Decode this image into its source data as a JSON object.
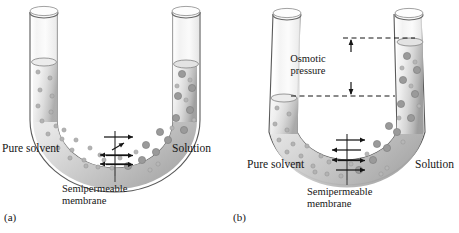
{
  "figure": {
    "background_color": "#ffffff",
    "ink_color": "#161616"
  },
  "panels": [
    {
      "id": "a",
      "sublabel": "(a)",
      "left_label": "Pure solvent",
      "right_label": "Solution",
      "membrane_label": "Semipermeable\nmembrane",
      "state": "initial",
      "left_level_y": 62,
      "right_level_y": 64,
      "flow_arrows": [
        {
          "direction": "right",
          "y": 137
        },
        {
          "direction": "right-diagonal-up",
          "y": 147
        },
        {
          "direction": "left",
          "y": 155
        },
        {
          "direction": "right",
          "y": 155
        },
        {
          "direction": "left",
          "y": 164
        },
        {
          "direction": "right",
          "y": 164
        }
      ]
    },
    {
      "id": "b",
      "sublabel": "(b)",
      "left_label": "Pure solvent",
      "right_label": "Solution",
      "membrane_label": "Semipermeable\nmembrane",
      "osmotic_pressure_label": "Osmotic\npressure",
      "state": "equilibrium",
      "left_level_y": 98,
      "right_level_y": 42,
      "dashed_line_top_y": 38,
      "dashed_line_bottom_y": 96,
      "flow_arrows": [
        {
          "direction": "right",
          "y": 140
        },
        {
          "direction": "left",
          "y": 150
        },
        {
          "direction": "left",
          "y": 160
        },
        {
          "direction": "right",
          "y": 160
        },
        {
          "direction": "right",
          "y": 170
        }
      ]
    }
  ],
  "legend": {
    "solvent_particle": "small-circle",
    "solute_particle": "large-circle"
  }
}
